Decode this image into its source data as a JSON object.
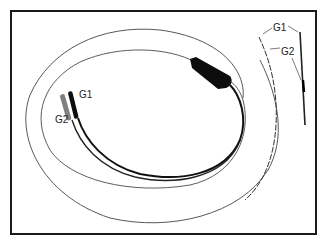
{
  "figure": {
    "labels": {
      "connector_g1": "G1",
      "connector_g2": "G2",
      "tip_g1": "G1",
      "tip_g2": "G2"
    },
    "colors": {
      "border": "#1a1a1a",
      "lead": "#111111",
      "thin_wire": "#555555",
      "pin_g2": "#777777",
      "background": "#ffffff"
    }
  }
}
